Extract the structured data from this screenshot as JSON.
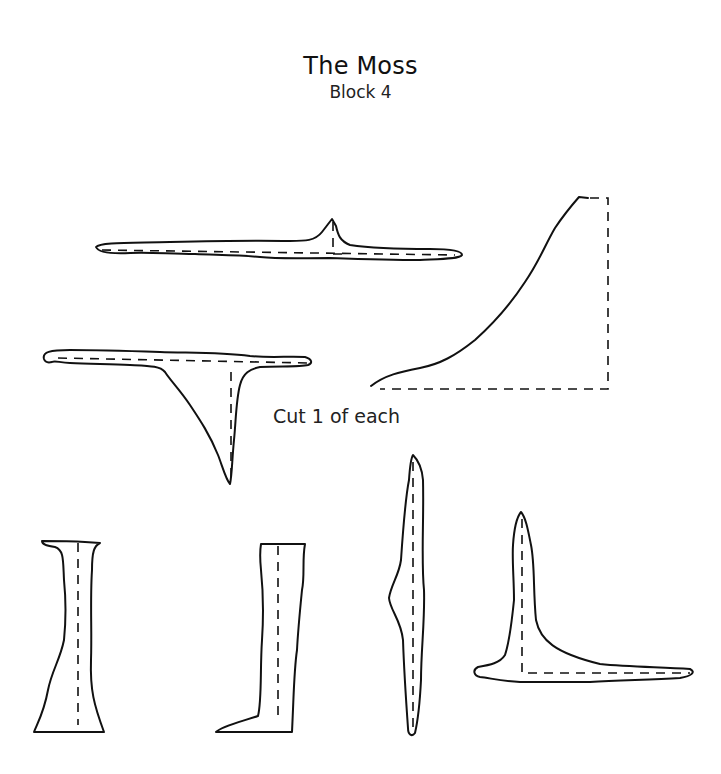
{
  "header": {
    "title": "The Moss",
    "subtitle": "Block 4"
  },
  "instructions": {
    "note": "Cut 1 of each"
  },
  "pieces": [
    {
      "id": "piece-1",
      "shape": "horizontal strip with peak"
    },
    {
      "id": "piece-2",
      "shape": "right-angle curved corner"
    },
    {
      "id": "piece-3",
      "shape": "T-shape with triangular drop"
    },
    {
      "id": "piece-4",
      "shape": "vertical flared column"
    },
    {
      "id": "piece-5",
      "shape": "vertical boot shape"
    },
    {
      "id": "piece-6",
      "shape": "vertical tapered sliver"
    },
    {
      "id": "piece-7",
      "shape": "L-shape"
    }
  ],
  "colors": {
    "ink": "#111111",
    "background": "#ffffff"
  }
}
